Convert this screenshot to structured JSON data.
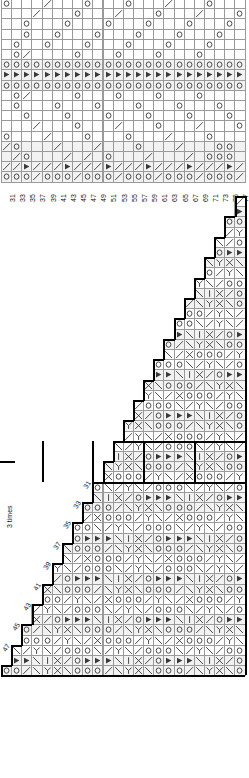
{
  "document": {
    "type": "lace-knitting-chart",
    "title": "",
    "charts": [
      {
        "id": "chart-top",
        "shape": "rectangular",
        "columns": 24,
        "rows": 18,
        "column_labels": [
          "31",
          "33",
          "35",
          "37",
          "39",
          "41",
          "43",
          "45",
          "47",
          "49",
          "51",
          "53",
          "55",
          "57",
          "59",
          "61",
          "63",
          "65",
          "67",
          "69",
          "71",
          "73",
          "75",
          "77"
        ],
        "column_label_position": "bottom",
        "row_labels": [],
        "note": ""
      },
      {
        "id": "chart-bottom",
        "shape": "triangular-staircase",
        "columns": 24,
        "rows": 47,
        "diagonal_labels": [
          "31",
          "33",
          "35",
          "37",
          "39",
          "41",
          "43",
          "45",
          "47",
          "49",
          "51",
          "53",
          "55",
          "57",
          "59",
          "61",
          "63",
          "65",
          "67",
          "69",
          "71",
          "73",
          "75"
        ],
        "side_note": "3 times",
        "note": ""
      }
    ],
    "symbols": {
      "yarn_over": "O",
      "k2tog": "/",
      "ssk": "\\",
      "cross": "X",
      "filled_triangle": "▶",
      "purl_mark": "┐",
      "blank": ""
    },
    "colors": {
      "grid_line": "#9a9a9a",
      "grid_line_light": "#b4b4b4",
      "symbol": "#333333",
      "bold_outline": "#000000",
      "shade": "#f2f2f2",
      "background": "#ffffff",
      "label": "#111111"
    }
  }
}
